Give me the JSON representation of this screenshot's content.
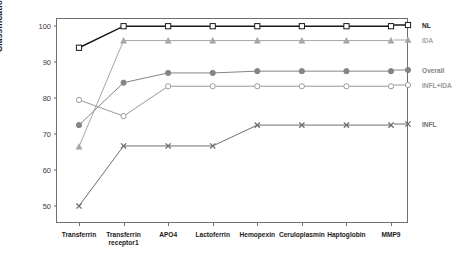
{
  "chart_data": {
    "type": "line",
    "title": "",
    "xlabel": "",
    "ylabel": "Classification Accuracy (%)",
    "ylim": [
      45,
      102
    ],
    "yticks": [
      50,
      60,
      70,
      80,
      90,
      100
    ],
    "grid": false,
    "legend_position": "right",
    "categories": [
      "Transferrin",
      "Transferrin receptor1",
      "APO4",
      "Lactoferrin",
      "Hemopexin",
      "Ceruloplasmin",
      "Haptoglobin",
      "MMP9"
    ],
    "series": [
      {
        "name": "NL",
        "marker": "open-square",
        "color": "#1a1a1a",
        "values": [
          94,
          100,
          100,
          100,
          100,
          100,
          100,
          100
        ]
      },
      {
        "name": "IDA",
        "marker": "filled-triangle",
        "color": "#a6a6a6",
        "values": [
          66.5,
          96,
          96,
          96,
          96,
          96,
          96,
          96
        ]
      },
      {
        "name": "Overall",
        "marker": "filled-circle",
        "color": "#848484",
        "values": [
          72.5,
          84.3,
          87,
          87,
          87.5,
          87.5,
          87.5,
          87.5
        ]
      },
      {
        "name": "INFL+IDA",
        "marker": "open-circle",
        "color": "#9a9a9a",
        "values": [
          79.5,
          75,
          83.3,
          83.3,
          83.3,
          83.3,
          83.3,
          83.3
        ]
      },
      {
        "name": "INFL",
        "marker": "cross-x",
        "color": "#6e6e6e",
        "values": [
          50,
          66.7,
          66.7,
          66.7,
          72.5,
          72.5,
          72.5,
          72.5
        ]
      }
    ]
  },
  "legend": {
    "entries": [
      {
        "label": "NL"
      },
      {
        "label": "IDA"
      },
      {
        "label": "Overall"
      },
      {
        "label": "INFL+IDA"
      },
      {
        "label": "INFL"
      }
    ]
  }
}
